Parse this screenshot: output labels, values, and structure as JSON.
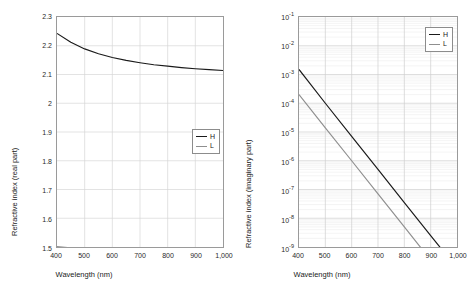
{
  "chart_data": [
    {
      "type": "line",
      "id": "refractive-index-real",
      "title": "",
      "xlabel": "Wavelength (nm)",
      "ylabel": "Refractive index (real part)",
      "xlim": [
        400,
        1000
      ],
      "ylim": [
        1.5,
        2.3
      ],
      "yscale": "linear",
      "xscale": "linear",
      "grid": true,
      "legend_position": "center-right",
      "xticks": [
        400,
        500,
        600,
        700,
        800,
        900,
        1000
      ],
      "xticklabels": [
        "400",
        "500",
        "600",
        "700",
        "800",
        "900",
        "1,000"
      ],
      "yticks": [
        1.5,
        1.6,
        1.7,
        1.8,
        1.9,
        2.0,
        2.1,
        2.2,
        2.3
      ],
      "yticklabels": [
        "1.5",
        "1.6",
        "1.7",
        "1.8",
        "1.9",
        "2",
        "2.1",
        "2.2",
        "2.3"
      ],
      "x": [
        400,
        450,
        500,
        550,
        600,
        650,
        700,
        750,
        800,
        850,
        900,
        950,
        1000
      ],
      "series": [
        {
          "name": "H",
          "color": "#1a1a1a",
          "values": [
            2.243,
            2.212,
            2.189,
            2.172,
            2.159,
            2.149,
            2.141,
            2.134,
            2.129,
            2.124,
            2.12,
            2.117,
            2.114
          ]
        },
        {
          "name": "L",
          "color": "#8f8f8f",
          "values": [
            1.501,
            1.497,
            1.494,
            1.491,
            1.489,
            1.487,
            1.486,
            1.484,
            1.483,
            1.482,
            1.481,
            1.48,
            1.479
          ]
        }
      ]
    },
    {
      "type": "line",
      "id": "refractive-index-imaginary",
      "title": "",
      "xlabel": "Wavelength (nm)",
      "ylabel": "Refractive index (imaginary part)",
      "xlim": [
        400,
        1000
      ],
      "ylim": [
        1e-09,
        0.1
      ],
      "yscale": "log",
      "xscale": "linear",
      "grid": true,
      "legend_position": "upper-right",
      "xticks": [
        400,
        500,
        600,
        700,
        800,
        900,
        1000
      ],
      "xticklabels": [
        "400",
        "500",
        "600",
        "700",
        "800",
        "900",
        "1,000"
      ],
      "yticks": [
        0.1,
        0.01,
        0.001,
        0.0001,
        1e-05,
        1e-06,
        1e-07,
        1e-08,
        1e-09
      ],
      "yticklabels": [
        "10-1",
        "10-2",
        "10-3",
        "10-4",
        "10-5",
        "10-6",
        "10-7",
        "10-8",
        "10-9"
      ],
      "yticklabels_exponents": [
        "-1",
        "-2",
        "-3",
        "-4",
        "-5",
        "-6",
        "-7",
        "-8",
        "-9"
      ],
      "ytick_mantissa": "10",
      "x": [
        400,
        500,
        600,
        700,
        800,
        900,
        1000
      ],
      "series": [
        {
          "name": "H",
          "color": "#1a1a1a",
          "values": [
            0.0015,
            0.0001,
            7e-06,
            5e-07,
            3.5e-08,
            2.5e-09,
            1.8e-10
          ]
        },
        {
          "name": "L",
          "color": "#8f8f8f",
          "values": [
            0.0002,
            1.4e-05,
            1e-06,
            7e-08,
            5e-09,
            3.5e-10,
            2.5e-11
          ]
        }
      ]
    }
  ],
  "legend": {
    "left": {
      "h": "H",
      "l": "L"
    },
    "right": {
      "h": "H",
      "l": "L"
    }
  }
}
